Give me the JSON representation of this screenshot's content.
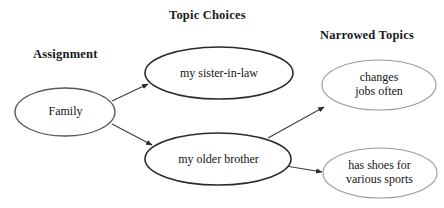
{
  "diagram": {
    "background_color": "#ffffff",
    "columns": [
      {
        "id": "assignment",
        "label": "Assignment"
      },
      {
        "id": "topic_choices",
        "label": "Topic Choices"
      },
      {
        "id": "narrowed_topics",
        "label": "Narrowed Topics"
      }
    ],
    "nodes": [
      {
        "id": "family",
        "label": "Family",
        "column": "assignment",
        "shape": "ellipse",
        "cx": 65,
        "cy": 112,
        "rx": 50,
        "ry": 24,
        "stroke": "#5a5a5a",
        "stroke_width": 1.3,
        "fill": "#ffffff"
      },
      {
        "id": "sister_in_law",
        "label": "my sister-in-law",
        "column": "topic_choices",
        "shape": "ellipse",
        "cx": 219,
        "cy": 73,
        "rx": 74,
        "ry": 26,
        "stroke": "#2b2b2b",
        "stroke_width": 1.6,
        "fill": "#ffffff"
      },
      {
        "id": "older_brother",
        "label": "my older brother",
        "column": "topic_choices",
        "shape": "ellipse",
        "cx": 218,
        "cy": 159,
        "rx": 73,
        "ry": 26,
        "stroke": "#2b2b2b",
        "stroke_width": 1.6,
        "fill": "#ffffff"
      },
      {
        "id": "changes_jobs",
        "label": "changes\njobs often",
        "column": "narrowed_topics",
        "shape": "ellipse",
        "cx": 379,
        "cy": 85,
        "rx": 57,
        "ry": 25,
        "stroke": "#9a9a9a",
        "stroke_width": 1.1,
        "fill": "#ffffff"
      },
      {
        "id": "has_shoes",
        "label": "has shoes for\nvarious sports",
        "column": "narrowed_topics",
        "shape": "ellipse",
        "cx": 380,
        "cy": 173,
        "rx": 57,
        "ry": 25,
        "stroke": "#9a9a9a",
        "stroke_width": 1.1,
        "fill": "#ffffff"
      }
    ],
    "edges": [
      {
        "id": "family-to-sister",
        "from": "family",
        "to": "sister_in_law",
        "x1": 112,
        "y1": 101,
        "x2": 148,
        "y2": 84,
        "stroke": "#3d3d3d",
        "stroke_width": 1.1,
        "arrowhead": true
      },
      {
        "id": "family-to-brother",
        "from": "family",
        "to": "older_brother",
        "x1": 112,
        "y1": 124,
        "x2": 152,
        "y2": 145,
        "stroke": "#3d3d3d",
        "stroke_width": 1.1,
        "arrowhead": true
      },
      {
        "id": "brother-to-changes",
        "from": "older_brother",
        "to": "changes_jobs",
        "x1": 268,
        "y1": 138,
        "x2": 324,
        "y2": 107,
        "stroke": "#3d3d3d",
        "stroke_width": 1.1,
        "arrowhead": true
      },
      {
        "id": "brother-to-shoes",
        "from": "older_brother",
        "to": "has_shoes",
        "x1": 286,
        "y1": 166,
        "x2": 322,
        "y2": 172,
        "stroke": "#3d3d3d",
        "stroke_width": 1.1,
        "arrowhead": true
      }
    ]
  }
}
